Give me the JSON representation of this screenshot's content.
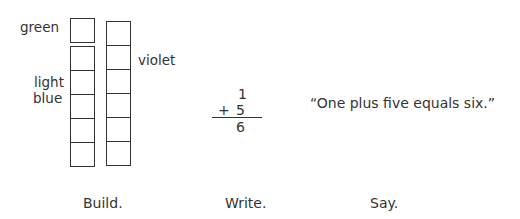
{
  "build": {
    "green_label": "green",
    "lightblue_label_line1": "light",
    "lightblue_label_line2": "blue",
    "violet_label": "violet",
    "green_rods": 1,
    "lightblue_rods": 5,
    "violet_rods": 6,
    "caption": "Build."
  },
  "write": {
    "addend1": "1",
    "operator": "+",
    "addend2": "5",
    "sum": "6",
    "caption": "Write."
  },
  "say": {
    "sentence": "“One plus five equals six.”",
    "caption": "Say."
  }
}
